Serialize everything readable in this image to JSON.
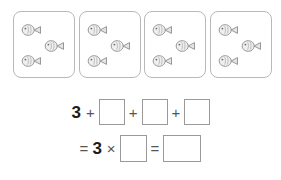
{
  "worksheet": {
    "title": "Fish groups multiplication worksheet",
    "background_color": "#ffffff",
    "card_border_color": "#b9b9b9",
    "blank_border_color": "#9a9a9a",
    "text_color": "#1a1a1a",
    "operator_color": "#555555"
  },
  "cards": [
    {
      "name": "card-1",
      "fish_count": 3,
      "icon": "fish-icon"
    },
    {
      "name": "card-2",
      "fish_count": 3,
      "icon": "fish-icon"
    },
    {
      "name": "card-3",
      "fish_count": 3,
      "icon": "fish-icon"
    },
    {
      "name": "card-4",
      "fish_count": 3,
      "icon": "fish-icon"
    }
  ],
  "equations": {
    "row1": {
      "first_number": "3",
      "plus_1": "+",
      "plus_2": "+",
      "plus_3": "+",
      "blank_1": "",
      "blank_2": "",
      "blank_3": ""
    },
    "row2": {
      "equals_lead": "=",
      "factor": "3",
      "times": "×",
      "blank_factor": "",
      "equals": "=",
      "blank_answer": ""
    }
  }
}
